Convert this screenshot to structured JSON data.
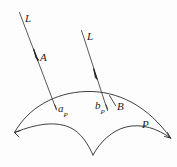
{
  "figure": {
    "background_color": "#fdfdfd",
    "stroke_color": "#2a2a2a",
    "label_color": "#1b1b1b",
    "labels": {
      "line_left": "L",
      "line_right": "L",
      "point_A": "A",
      "point_B": "B",
      "projection_a": "a",
      "projection_a_subscript": "P",
      "projection_b": "b",
      "projection_b_subscript": "P",
      "surface": "P"
    },
    "elements": {
      "surface_top_arc": "surface-top-arc",
      "surface_lower_left_arc": "surface-lower-left-arc",
      "surface_lower_right_arc": "surface-lower-right-arc",
      "left_ray": "left-ray",
      "right_ray": "right-ray",
      "left_arrowhead": "left-ray-arrowhead",
      "right_arrowhead": "right-ray-arrowhead",
      "point_A_marker": "point-a-marker",
      "tick_a_projection": "tick-a-projection",
      "tick_b_projection": "tick-b-projection"
    }
  }
}
